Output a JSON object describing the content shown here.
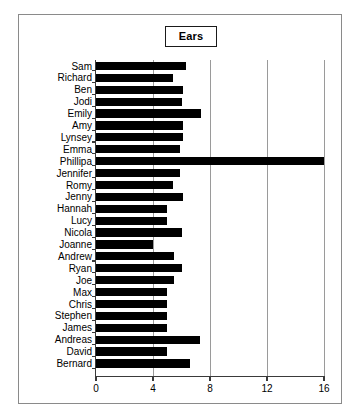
{
  "chart": {
    "title": "Ears",
    "xlabel": "",
    "ylabel": ""
  },
  "axis": {
    "x_ticks": [
      "0",
      "4",
      "8",
      "12",
      "16"
    ]
  },
  "chart_data": {
    "type": "bar",
    "orientation": "horizontal",
    "title": "Ears",
    "xlabel": "",
    "ylabel": "",
    "xlim": [
      0,
      16
    ],
    "xticks": [
      0,
      4,
      8,
      12,
      16
    ],
    "grid": true,
    "gridlines_x": [
      4,
      8,
      12,
      16
    ],
    "legend": null,
    "bar_color": "#000000",
    "categories": [
      "Sam",
      "Richard",
      "Ben",
      "Jodi",
      "Emily",
      "Amy",
      "Lynsey",
      "Emma",
      "Phillipa",
      "Jennifer",
      "Romy",
      "Jenny",
      "Hannah",
      "Lucy",
      "Nicola",
      "Joanne",
      "Andrew",
      "Ryan",
      "Joe",
      "Max",
      "Chris",
      "Stephen",
      "James",
      "Andreas",
      "David",
      "Bernard"
    ],
    "values": [
      6.3,
      5.4,
      6.1,
      6.0,
      7.4,
      6.1,
      6.1,
      5.9,
      16.0,
      5.9,
      5.4,
      6.1,
      5.0,
      5.0,
      6.0,
      4.0,
      5.5,
      6.0,
      5.5,
      5.0,
      5.0,
      5.0,
      5.0,
      7.3,
      5.0,
      6.6
    ]
  }
}
